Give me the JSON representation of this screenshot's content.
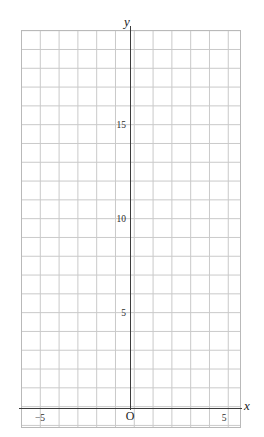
{
  "figure": {
    "kind": "cartesian-coordinate-grid",
    "background_color": "#ffffff",
    "grid_color": "#c9c9c9",
    "axis_color": "#3c3c3c",
    "label_color": "#1a1a1a"
  },
  "axes": {
    "x_name": "x",
    "y_name": "y",
    "origin_label": "O"
  },
  "ticks": {
    "x": [
      {
        "label": "−5",
        "value": -5
      },
      {
        "label": "5",
        "value": 5
      }
    ],
    "y": [
      {
        "label": "5",
        "value": 5
      },
      {
        "label": "10",
        "value": 10
      },
      {
        "label": "15",
        "value": 15
      }
    ]
  },
  "chart_data": {
    "type": "scatter",
    "title": "",
    "xlabel": "x",
    "ylabel": "y",
    "x": [],
    "y": [],
    "series": [],
    "xlim": [
      -5.8,
      5.9
    ],
    "ylim": [
      -1.1,
      20.1
    ],
    "xticks": [
      -5,
      5
    ],
    "yticks": [
      5,
      10,
      15
    ],
    "xtick_labels": [
      "−5",
      "5"
    ],
    "ytick_labels": [
      "5",
      "10",
      "15"
    ],
    "grid": true,
    "grid_step_x": 1,
    "grid_step_y": 1,
    "legend": null,
    "annotations": [
      {
        "text": "O",
        "role": "origin-label"
      },
      {
        "text": "y",
        "role": "y-axis-name"
      },
      {
        "text": "x",
        "role": "x-axis-name"
      }
    ]
  }
}
